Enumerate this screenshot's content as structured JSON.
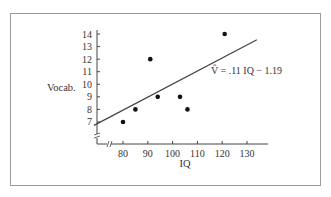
{
  "chart_data": {
    "type": "scatter",
    "title": "",
    "xlabel": "IQ",
    "ylabel": "Vocab.",
    "xlim": [
      70,
      138
    ],
    "ylim": [
      6,
      14.2
    ],
    "x_ticks": [
      "80",
      "90",
      "100",
      "110",
      "120",
      "130"
    ],
    "y_ticks": [
      "7",
      "8",
      "9",
      "10",
      "11",
      "12",
      "13",
      "14"
    ],
    "axis_breaks": true,
    "grid": false,
    "points": [
      {
        "x": 80,
        "y": 7
      },
      {
        "x": 85,
        "y": 8
      },
      {
        "x": 91,
        "y": 12
      },
      {
        "x": 94,
        "y": 9
      },
      {
        "x": 103,
        "y": 9
      },
      {
        "x": 106,
        "y": 8
      },
      {
        "x": 121,
        "y": 14
      }
    ],
    "regression_line": {
      "slope": 0.11,
      "intercept": -1.19,
      "x_range": [
        71,
        134
      ]
    },
    "annotation": "V̂ = .11 IQ − 1.19"
  },
  "labels": {
    "ylabel": "Vocab.",
    "xlabel": "IQ",
    "equation": "V̂ = .11 IQ − 1.19"
  }
}
